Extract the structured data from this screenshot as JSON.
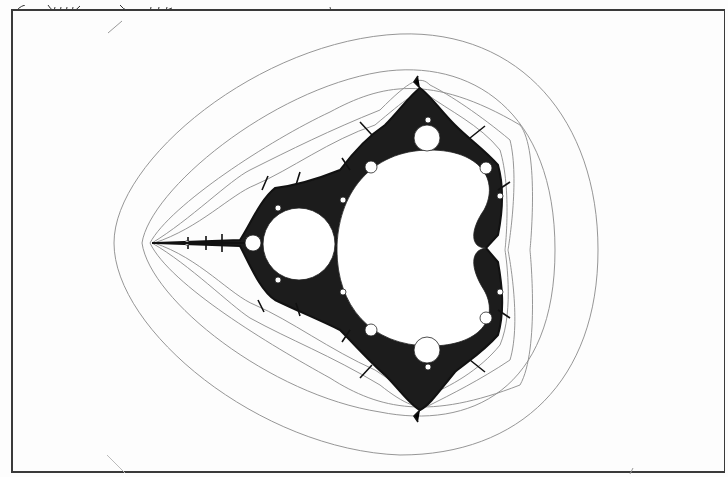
{
  "figure": {
    "rendering": "black-and-white line illustration in bordered frame",
    "colors": {
      "background": "#fdfdfd",
      "frame": "#3a3a3a",
      "set_fill": "#ffffff",
      "boundary": "#1a1a1a",
      "contour": "#7a7a7a"
    }
  },
  "page": {
    "top_cutoff_text": "",
    "bleed_through_lines": [
      "",
      "",
      "",
      "",
      "",
      "",
      "",
      "",
      "",
      "",
      "",
      "",
      "",
      "",
      "",
      "",
      "",
      ""
    ]
  }
}
